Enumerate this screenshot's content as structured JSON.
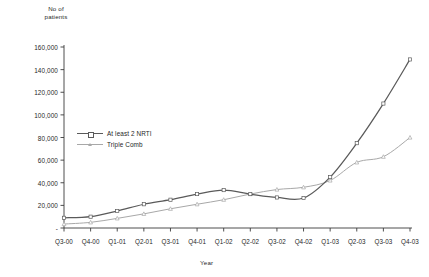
{
  "chart_data": {
    "type": "line",
    "title": "",
    "xlabel": "Year",
    "ylabel": "No of\npatients",
    "categories": [
      "Q3-00",
      "Q4-00",
      "Q1-01",
      "Q2-01",
      "Q3-01",
      "Q4-01",
      "Q1-02",
      "Q2-02",
      "Q3-02",
      "Q4-02",
      "Q1-03",
      "Q2-03",
      "Q3-03",
      "Q4-03"
    ],
    "ylim": [
      0,
      160000
    ],
    "yticks": [
      0,
      20000,
      40000,
      60000,
      80000,
      100000,
      120000,
      140000,
      160000
    ],
    "ytick_labels": [
      "-",
      "20,000",
      "40,000",
      "60,000",
      "80,000",
      "100,000",
      "120,000",
      "140,000",
      "160,000"
    ],
    "grid": false,
    "legend_position": "upper-left-inside",
    "series": [
      {
        "name": "At least 2 NRTI",
        "color": "#5a5a5a",
        "marker": "square",
        "values": [
          9000,
          10000,
          15000,
          21000,
          25000,
          30000,
          33500,
          30000,
          27000,
          26500,
          45000,
          75000,
          110000,
          149000
        ]
      },
      {
        "name": "Triple Comb",
        "color": "#a8a8a8",
        "marker": "triangle",
        "values": [
          3500,
          5000,
          8500,
          12500,
          17000,
          21000,
          25000,
          30000,
          34000,
          36000,
          42000,
          58000,
          63000,
          80000
        ]
      }
    ]
  },
  "axes": {
    "y_title": "No of\npatients",
    "x_title": "Year"
  },
  "colors": {
    "series_1": "#5a5a5a",
    "series_2": "#a8a8a8",
    "axis": "#3b3b3b",
    "background": "#ffffff"
  }
}
